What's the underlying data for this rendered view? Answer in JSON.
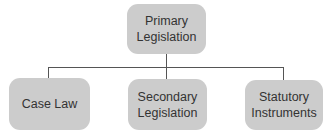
{
  "diagram": {
    "type": "hierarchy",
    "root": {
      "label_line1": "Primary",
      "label_line2": "Legislation"
    },
    "children": [
      {
        "label_line1": "Case Law",
        "label_line2": ""
      },
      {
        "label_line1": "Secondary",
        "label_line2": "Legislation"
      },
      {
        "label_line1": "Statutory",
        "label_line2": "Instruments"
      }
    ]
  },
  "colors": {
    "node_fill": "#cccccc",
    "text": "#333333",
    "connector": "#555555"
  }
}
